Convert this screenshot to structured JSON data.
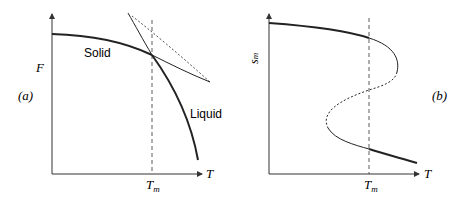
{
  "panel_a": {
    "tag": "(a)",
    "ylabel": "F",
    "xlabel": "T",
    "tick_label": "T",
    "tick_sub": "m",
    "solid_label": "Solid",
    "liquid_label": "Liquid"
  },
  "panel_b": {
    "tag": "(b)",
    "ylabel": "s",
    "ylabel_sub": "m",
    "xlabel": "T",
    "tick_label": "T",
    "tick_sub": "m"
  },
  "colors": {
    "line": "#222222",
    "axis": "#333333"
  }
}
